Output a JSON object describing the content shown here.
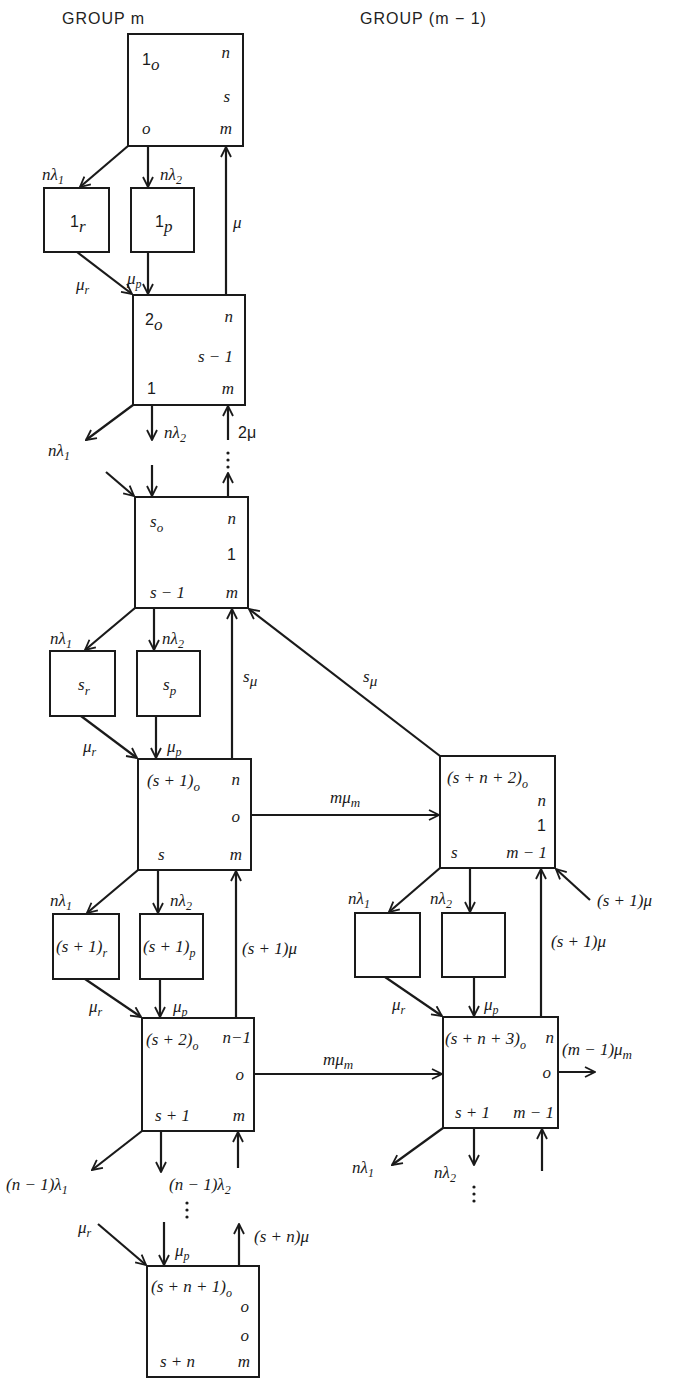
{
  "headers": {
    "left": "GROUP m",
    "right": "GROUP (m − 1)"
  },
  "nodes": [
    {
      "id": "1o",
      "x": 128,
      "y": 34,
      "w": 115,
      "h": 112,
      "title": "1",
      "title_sub": "o",
      "tr": "n",
      "mr": "s",
      "bl": "o",
      "br": "m"
    },
    {
      "id": "1r",
      "x": 44,
      "y": 188,
      "w": 65,
      "h": 64,
      "center": "1",
      "center_sub": "r"
    },
    {
      "id": "1p",
      "x": 131,
      "y": 188,
      "w": 63,
      "h": 64,
      "center": "1",
      "center_sub": "p"
    },
    {
      "id": "2o",
      "x": 133,
      "y": 295,
      "w": 112,
      "h": 110,
      "title": "2",
      "title_sub": "o",
      "tr": "n",
      "mr": "s − 1",
      "bl": "1",
      "br": "m"
    },
    {
      "id": "so",
      "x": 135,
      "y": 497,
      "w": 113,
      "h": 111,
      "title": "s",
      "title_sub": "o",
      "tr": "n",
      "mr": "1",
      "bl": "s − 1",
      "br": "m"
    },
    {
      "id": "sr",
      "x": 50,
      "y": 651,
      "w": 65,
      "h": 65,
      "center": "s",
      "center_sub": "r"
    },
    {
      "id": "sp",
      "x": 137,
      "y": 651,
      "w": 63,
      "h": 65,
      "center": "s",
      "center_sub": "p"
    },
    {
      "id": "s1o",
      "x": 138,
      "y": 759,
      "w": 113,
      "h": 111,
      "title": "(s + 1)",
      "title_sub": "o",
      "tr": "n",
      "mr": "o",
      "bl": "s",
      "br": "m"
    },
    {
      "id": "s1r",
      "x": 53,
      "y": 914,
      "w": 66,
      "h": 65,
      "center": "(s + 1)",
      "center_sub": "r"
    },
    {
      "id": "s1p",
      "x": 140,
      "y": 914,
      "w": 63,
      "h": 65,
      "center": "(s + 1)",
      "center_sub": "p"
    },
    {
      "id": "s2o",
      "x": 142,
      "y": 1018,
      "w": 112,
      "h": 113,
      "title": "(s + 2)",
      "title_sub": "o",
      "tr": "n−1",
      "mr": "o",
      "bl": "s + 1",
      "br": "m"
    },
    {
      "id": "sn1o",
      "x": 147,
      "y": 1266,
      "w": 112,
      "h": 111,
      "title": "(s + n + 1)",
      "title_sub": "o",
      "r1": "o",
      "r2": "o",
      "bl": "s + n",
      "br": "m"
    },
    {
      "id": "sn2o",
      "x": 440,
      "y": 756,
      "w": 115,
      "h": 112,
      "title": "(s + n + 2)",
      "title_sub": "o",
      "r1": "n",
      "r2": "1",
      "bl": "s",
      "br": "m − 1"
    },
    {
      "id": "blankr",
      "x": 355,
      "y": 913,
      "w": 65,
      "h": 64
    },
    {
      "id": "blankp",
      "x": 442,
      "y": 913,
      "w": 63,
      "h": 64
    },
    {
      "id": "sn3o",
      "x": 443,
      "y": 1017,
      "w": 115,
      "h": 111,
      "title": "(s + n + 3)",
      "title_sub": "o",
      "tr": "n",
      "mr": "o",
      "bl": "s + 1",
      "br": "m − 1"
    }
  ],
  "edge_labels": {
    "nl1_a": "nλ",
    "nl1_a_sub": "1",
    "nl2_a": "nλ",
    "nl2_a_sub": "2",
    "mu_a": "μ",
    "mur_a": "μ",
    "mur_a_sub": "r",
    "mup_a": "μ",
    "mup_a_sub": "p",
    "nl1_b": "nλ",
    "nl1_b_sub": "1",
    "nl2_b": "nλ",
    "nl2_b_sub": "2",
    "twomu": "2μ",
    "nl1_c": "nλ",
    "nl1_c_sub": "1",
    "nl2_c": "nλ",
    "nl2_c_sub": "2",
    "smu_a": "s",
    "smu_a_sub": "μ",
    "smu_b": "s",
    "smu_b_sub": "μ",
    "mur_c": "μ",
    "mur_c_sub": "r",
    "mup_c": "μ",
    "mup_c_sub": "p",
    "mmum_a": "mμ",
    "mmum_a_sub": "m",
    "nl1_d": "nλ",
    "nl1_d_sub": "1",
    "nl2_d": "nλ",
    "nl2_d_sub": "2",
    "s1mu_a": "(s + 1)μ",
    "mur_d": "μ",
    "mur_d_sub": "r",
    "mup_d": "μ",
    "mup_d_sub": "p",
    "mmum_b": "mμ",
    "mmum_b_sub": "m",
    "n1l1": "(n − 1)λ",
    "n1l1_sub": "1",
    "n1l2": "(n − 1)λ",
    "n1l2_sub": "2",
    "mur_e": "μ",
    "mur_e_sub": "r",
    "mup_e": "μ",
    "mup_e_sub": "p",
    "snmu": "(s + n)μ",
    "nl1_r": "nλ",
    "nl1_r_sub": "1",
    "nl2_r": "nλ",
    "nl2_r_sub": "2",
    "s1mu_r_in": "(s + 1)μ",
    "s1mu_r": "(s  + 1)μ",
    "mur_r": "μ",
    "mur_r_sub": "r",
    "mup_r": "μ",
    "mup_r_sub": "p",
    "m1mum": "(m − 1)μ",
    "m1mum_sub": "m",
    "nl1_r2": "nλ",
    "nl1_r2_sub": "1",
    "nl2_r2": "nλ",
    "nl2_r2_sub": "2"
  }
}
